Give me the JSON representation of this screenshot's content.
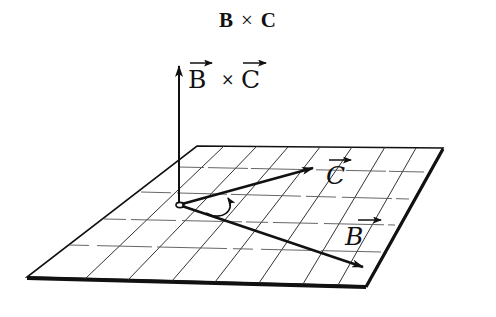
{
  "title": {
    "left_operand": "B",
    "operator": "×",
    "right_operand": "C"
  },
  "diagram": {
    "vectors": [
      {
        "id": "cross",
        "label": "B×C",
        "label_parts": [
          "B",
          "×",
          "C"
        ],
        "direction": "perpendicular to plane (up)"
      },
      {
        "id": "C",
        "label": "C",
        "direction": "in plane, toward back-right"
      },
      {
        "id": "B",
        "label": "B",
        "direction": "in plane, toward front-right"
      }
    ],
    "rotation_arrow": {
      "from": "B",
      "to": "C",
      "meaning": "right-hand rotation from B toward C"
    },
    "plane": {
      "grid": true
    },
    "colors": {
      "ink": "#111111",
      "background": "#ffffff",
      "grid": "#333333"
    }
  }
}
